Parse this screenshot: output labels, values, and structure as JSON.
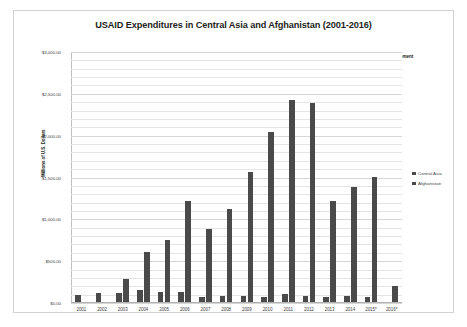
{
  "chart_data": {
    "type": "bar",
    "title": "USAID Expenditures in Central Asia and Afghanistan (2001-2016)",
    "xlabel": "",
    "ylabel": "Millions of U.S. Dollars",
    "ylim": [
      0,
      3000
    ],
    "ytick_values": [
      0,
      500,
      1000,
      1500,
      2000,
      2500,
      3000
    ],
    "ytick_labels": [
      "$0.00",
      "$500.00",
      "$1,000.00",
      "$1,500.00",
      "$2,000.00",
      "$2,500.00",
      "$3,000.00"
    ],
    "grid": true,
    "minor_gridlines": true,
    "legend_position": "right",
    "categories": [
      "2001",
      "2002",
      "2003",
      "2004",
      "2005",
      "2006",
      "2007",
      "2008",
      "2009",
      "2010",
      "2011",
      "2012",
      "2013",
      "2014",
      "2015*",
      "2016*"
    ],
    "series": [
      {
        "name": "Central Asia",
        "color": "#4a4a4a",
        "values": [
          98,
          120,
          125,
          150,
          135,
          128,
          70,
          78,
          88,
          68,
          105,
          85,
          75,
          88,
          70,
          18
        ]
      },
      {
        "name": "Afghanistan",
        "color": "#4a4a4a",
        "values": [
          10,
          0,
          282,
          605,
          750,
          1215,
          880,
          1125,
          1565,
          2040,
          2430,
          2385,
          1215,
          1390,
          1505,
          200
        ]
      }
    ],
    "annotations": [
      "Source: U.S. Agency for International Development",
      "*The selected year is not yet fully reported."
    ]
  },
  "legend": {
    "items": [
      {
        "label": "Central Asia"
      },
      {
        "label": "Afghanistan"
      }
    ]
  }
}
